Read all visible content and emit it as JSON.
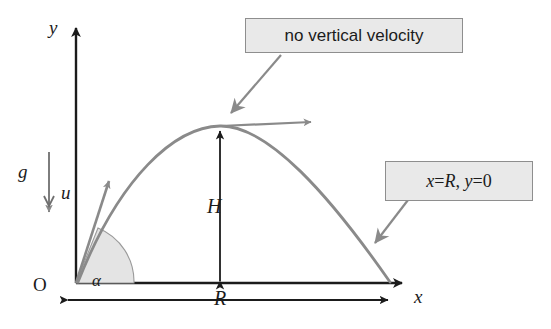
{
  "figure": {
    "colors": {
      "axis": "#1b1b1b",
      "trajectory": "#8a8a8a",
      "callout_fill": "#e9e9e9",
      "callout_border": "#8e8e8e",
      "arc_fill": "#e2e2e2",
      "leader": "#8a8a8a"
    }
  },
  "axes": {
    "y_label": "y",
    "x_label": "x",
    "origin_label": "O"
  },
  "vectors": {
    "gravity_label": "g",
    "initial_velocity_label": "u",
    "angle_label": "α"
  },
  "dimensions": {
    "height_label": "H",
    "range_label": "R"
  },
  "callouts": [
    {
      "id": "apex-callout",
      "text": "no vertical velocity",
      "style": "plain"
    },
    {
      "id": "landing-callout",
      "text": "x = R,  y = 0",
      "style": "math",
      "parts": {
        "x": "x",
        "eq1": "=",
        "R": "R",
        "comma": ",",
        "y": "y",
        "eq2": "=",
        "zero": "0"
      }
    }
  ]
}
